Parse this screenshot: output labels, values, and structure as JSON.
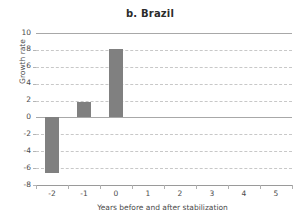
{
  "chart_data": {
    "type": "bar",
    "title": "b. Brazil",
    "xlabel": "Years before and after stabilization",
    "ylabel": "Growth rate",
    "categories": [
      "-2",
      "-1",
      "0",
      "1",
      "2",
      "3",
      "4",
      "5"
    ],
    "values": [
      -6.6,
      1.85,
      8.1,
      null,
      null,
      null,
      null,
      null
    ],
    "series": [
      {
        "name": "Growth rate",
        "values": [
          -6.6,
          1.85,
          8.1,
          null,
          null,
          null,
          null,
          null
        ]
      }
    ],
    "ylim": [
      -8,
      10
    ],
    "ytick_labels": [
      "10",
      "8",
      "6",
      "4",
      "2",
      "0",
      "-2",
      "-4",
      "-6",
      "-8"
    ],
    "ytick_values": [
      10,
      8,
      6,
      4,
      2,
      0,
      -2,
      -4,
      -6,
      -8
    ],
    "xtick_labels": [
      "-2",
      "-1",
      "0",
      "1",
      "2",
      "3",
      "4",
      "5"
    ],
    "grid": true,
    "grid_style": "dashed",
    "legend": "none",
    "bar_color": "#808080",
    "grid_color": "#c8c8c8",
    "axis_color": "#9a9a9a",
    "baseline_color": "#a8a8a8",
    "text_color": "#4a4a4a"
  }
}
